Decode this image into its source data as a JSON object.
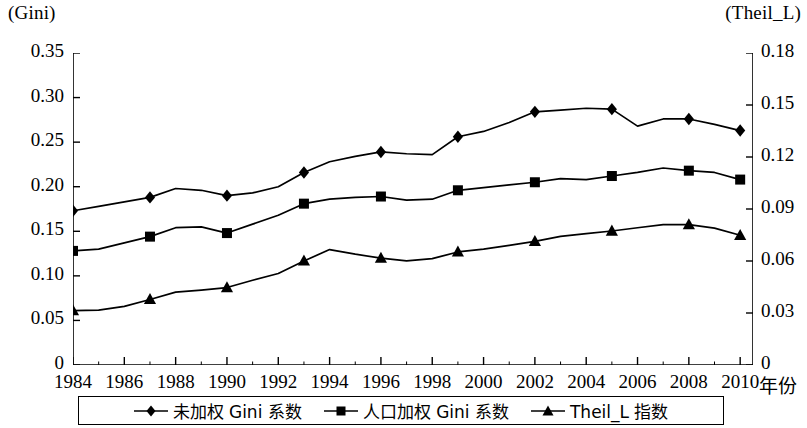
{
  "axes": {
    "left_unit": "(Gini)",
    "right_unit": "(Theil_L)",
    "xaxis_title": "年份"
  },
  "legend": {
    "items": [
      {
        "label": "未加权 Gini 系数",
        "marker": "diamond-marker-icon"
      },
      {
        "label": "人口加权 Gini 系数",
        "marker": "square-marker-icon"
      },
      {
        "label": "Theil_L 指数",
        "marker": "triangle-marker-icon"
      }
    ]
  },
  "chart_data": {
    "type": "line",
    "title": "",
    "xlabel": "年份",
    "ylabel": "(Gini)",
    "y2label": "(Theil_L)",
    "grid": false,
    "legend_position": "bottom",
    "xlim": [
      1984,
      2010.5
    ],
    "ylim": [
      0,
      0.35
    ],
    "y2lim": [
      0,
      0.18
    ],
    "xticks": [
      1984,
      1986,
      1988,
      1990,
      1992,
      1994,
      1996,
      1998,
      2000,
      2002,
      2004,
      2006,
      2008,
      2010
    ],
    "xtick_labels": [
      "1984",
      "1986",
      "1988",
      "1990",
      "1992",
      "1994",
      "1996",
      "1998",
      "2000",
      "2002",
      "2004",
      "2006",
      "2008",
      "2010"
    ],
    "yticks": [
      0,
      0.05,
      0.1,
      0.15,
      0.2,
      0.25,
      0.3,
      0.35
    ],
    "ytick_labels": [
      "0",
      "0.05",
      "0.10",
      "0.15",
      "0.20",
      "0.25",
      "0.30",
      "0.35"
    ],
    "y2ticks": [
      0,
      0.03,
      0.06,
      0.09,
      0.12,
      0.15,
      0.18
    ],
    "y2tick_labels": [
      "0",
      "0.03",
      "0.06",
      "0.09",
      "0.12",
      "0.15",
      "0.18"
    ],
    "x": [
      1984,
      1985,
      1986,
      1987,
      1988,
      1989,
      1990,
      1991,
      1992,
      1993,
      1994,
      1995,
      1996,
      1997,
      1998,
      1999,
      2000,
      2001,
      2002,
      2003,
      2004,
      2005,
      2006,
      2007,
      2008,
      2009,
      2010
    ],
    "marker_years": [
      1984,
      1987,
      1990,
      1993,
      1996,
      1999,
      2002,
      2005,
      2008,
      2010
    ],
    "series": [
      {
        "name": "未加权 Gini 系数",
        "axis": "left",
        "marker": "diamond",
        "values": [
          0.173,
          0.178,
          0.183,
          0.188,
          0.198,
          0.196,
          0.19,
          0.193,
          0.2,
          0.216,
          0.228,
          0.234,
          0.239,
          0.237,
          0.236,
          0.256,
          0.262,
          0.272,
          0.284,
          0.286,
          0.288,
          0.287,
          0.268,
          0.276,
          0.276,
          0.27,
          0.263
        ],
        "marker_values": [
          0.173,
          0.188,
          0.19,
          0.216,
          0.239,
          0.256,
          0.284,
          0.287,
          0.276,
          0.263
        ]
      },
      {
        "name": "人口加权 Gini 系数",
        "axis": "left",
        "marker": "square",
        "values": [
          0.128,
          0.13,
          0.137,
          0.144,
          0.154,
          0.155,
          0.148,
          0.158,
          0.168,
          0.181,
          0.186,
          0.188,
          0.189,
          0.185,
          0.186,
          0.196,
          0.199,
          0.202,
          0.205,
          0.209,
          0.208,
          0.212,
          0.216,
          0.221,
          0.218,
          0.216,
          0.208
        ],
        "marker_values": [
          0.128,
          0.144,
          0.148,
          0.181,
          0.189,
          0.196,
          0.205,
          0.212,
          0.218,
          0.208
        ]
      },
      {
        "name": "Theil_L 指数",
        "axis": "right",
        "marker": "triangle",
        "values": [
          0.0314,
          0.0316,
          0.0338,
          0.0378,
          0.042,
          0.0432,
          0.0447,
          0.0489,
          0.0528,
          0.06,
          0.0666,
          0.0639,
          0.0616,
          0.0601,
          0.0614,
          0.0652,
          0.0668,
          0.069,
          0.0713,
          0.0742,
          0.0758,
          0.0773,
          0.0792,
          0.081,
          0.081,
          0.079,
          0.0748
        ],
        "marker_values": [
          0.0314,
          0.0378,
          0.0447,
          0.06,
          0.0616,
          0.0652,
          0.0713,
          0.0773,
          0.081,
          0.0748
        ],
        "left_axis_equivalent": [
          0.061,
          0.0615,
          0.0657,
          0.0735,
          0.0817,
          0.084,
          0.0869,
          0.0951,
          0.1027,
          0.1167,
          0.1295,
          0.1243,
          0.1198,
          0.1169,
          0.1194,
          0.1268,
          0.1299,
          0.1342,
          0.1386,
          0.1443,
          0.1474,
          0.1503,
          0.154,
          0.1575,
          0.1575,
          0.1536,
          0.1455
        ]
      }
    ]
  }
}
